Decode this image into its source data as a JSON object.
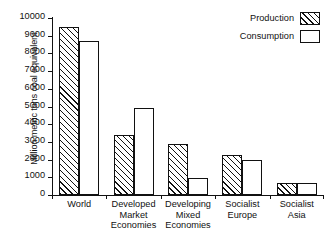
{
  "chart_data": {
    "type": "bar",
    "title": "",
    "xlabel": "",
    "ylabel": "Million metric tons coal equivalent",
    "ylim": [
      0,
      10000
    ],
    "yticks": [
      0,
      1000,
      2000,
      3000,
      4000,
      5000,
      6000,
      7000,
      8000,
      9000,
      10000
    ],
    "ytick_labels": [
      "0",
      "1000",
      "2000",
      "3000",
      "4000",
      "5000",
      "6000",
      "7000",
      "8000",
      "9000",
      "10000"
    ],
    "grid": false,
    "legend_position": "top-right",
    "categories": [
      "World",
      "Developed\nMarket\nEconomies",
      "Developing\nMixed\nEconomies",
      "Socialist\nEurope",
      "Socialist\nAsia"
    ],
    "series": [
      {
        "name": "Production",
        "pattern": "diagonal-hatch",
        "values": [
          9500,
          3400,
          2900,
          2250,
          700
        ]
      },
      {
        "name": "Consumption",
        "pattern": "dotted",
        "values": [
          8700,
          4900,
          950,
          1980,
          680
        ]
      }
    ]
  },
  "legend": {
    "items": [
      {
        "label": "Production",
        "pattern": "diagonal-hatch"
      },
      {
        "label": "Consumption",
        "pattern": "dotted"
      }
    ]
  },
  "colors": {
    "axis": "#111111",
    "text": "#111111",
    "background": "#ffffff",
    "pattern_ink": "#333333"
  }
}
